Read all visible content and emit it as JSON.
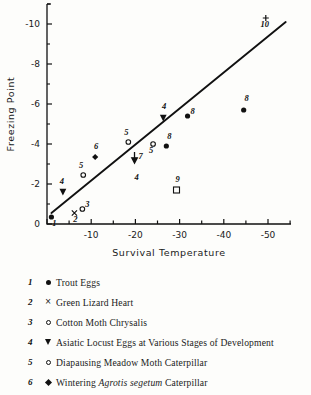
{
  "chart_data": {
    "type": "scatter",
    "title": "",
    "xlabel": "Survival Temperature",
    "ylabel": "Freezing Point",
    "xlim": [
      0,
      -55
    ],
    "ylim": [
      0,
      -11
    ],
    "xticks": [
      0,
      -10,
      -20,
      -30,
      -40,
      -50
    ],
    "xticklabels": [
      "",
      "-10",
      "-20",
      "-30",
      "-40",
      "-50"
    ],
    "yticks": [
      0,
      -2,
      -4,
      -6,
      -8,
      -10
    ],
    "yticklabels": [
      "0",
      "-2",
      "-4",
      "-6",
      "-8",
      "-10"
    ],
    "xminor_step": 5,
    "yminor_step": 1,
    "grid": false,
    "legend_position": "below-plot",
    "trend_line": {
      "label": "regression line",
      "x_start": -1.0,
      "y_start": -0.55,
      "x_end": -54.0,
      "y_end": -10.1
    },
    "points": [
      {
        "label": "1",
        "series": "Trout Eggs",
        "marker": "filled-circle",
        "x": -1.0,
        "y": -0.35,
        "label_dx": 3,
        "label_dy": 9
      },
      {
        "label": "2",
        "series": "Green Lizard Heart",
        "marker": "cross",
        "x": -6.2,
        "y": -0.55,
        "label_dx": 1,
        "label_dy": 9
      },
      {
        "label": "3",
        "series": "Cotton Moth Chrysalis",
        "marker": "open-circle",
        "x": -8.0,
        "y": -0.75,
        "label_dx": 5,
        "label_dy": -2
      },
      {
        "label": "4",
        "series": "Asiatic Locust Eggs at Various Stages of Development",
        "marker": "triangle-down",
        "x": -3.6,
        "y": -1.6,
        "label_dx": -1,
        "label_dy": -8
      },
      {
        "label": "5",
        "series": "Diapausing Meadow Moth Caterpillar",
        "marker": "open-circle",
        "x": -8.2,
        "y": -2.45,
        "label_dx": -2,
        "label_dy": -7
      },
      {
        "label": "6",
        "series": "Wintering Agrotis segetum Caterpillar",
        "marker": "diamond",
        "x": -10.9,
        "y": -3.35,
        "label_dx": 1,
        "label_dy": -8
      },
      {
        "label": "5",
        "series": "Diapausing Meadow Moth Caterpillar",
        "marker": "open-circle",
        "x": -18.4,
        "y": -4.1,
        "label_dx": -2,
        "label_dy": -7
      },
      {
        "label": "7",
        "series": "unlabeled-arrow",
        "marker": "arrow-down",
        "x": -19.8,
        "y": -3.2,
        "label_dx": 6,
        "label_dy": -1
      },
      {
        "label": "4",
        "series": "Asiatic Locust Eggs at Various Stages of Development",
        "marker": "none",
        "x": -20.3,
        "y": -2.6,
        "label_dx": 0,
        "label_dy": 8
      },
      {
        "label": "5",
        "series": "Diapausing Meadow Moth Caterpillar",
        "marker": "open-circle",
        "x": -24.0,
        "y": -4.0,
        "label_dx": -2,
        "label_dy": 9
      },
      {
        "label": "4",
        "series": "Asiatic Locust Eggs at Various Stages of Development",
        "marker": "triangle-down",
        "x": -26.3,
        "y": -5.3,
        "label_dx": 1,
        "label_dy": -9
      },
      {
        "label": "8",
        "series": "unlabeled-8",
        "marker": "filled-circle",
        "x": -27.0,
        "y": -3.9,
        "label_dx": 3,
        "label_dy": -7
      },
      {
        "label": "8",
        "series": "unlabeled-8",
        "marker": "filled-circle",
        "x": -31.8,
        "y": -5.4,
        "label_dx": 5,
        "label_dy": -2
      },
      {
        "label": "9",
        "series": "unlabeled-9",
        "marker": "open-square",
        "x": -29.3,
        "y": -1.7,
        "label_dx": 1,
        "label_dy": -8
      },
      {
        "label": "8",
        "series": "unlabeled-8",
        "marker": "filled-circle",
        "x": -44.5,
        "y": -5.7,
        "label_dx": 3,
        "label_dy": -9
      },
      {
        "label": "10",
        "series": "unlabeled-10",
        "marker": "plus",
        "x": -49.5,
        "y": -10.3,
        "label_dx": -1,
        "label_dy": 9
      }
    ]
  },
  "legend": {
    "items": [
      {
        "num": "1",
        "symbol": "filled-circle",
        "text": "Trout Eggs",
        "italic_part": ""
      },
      {
        "num": "2",
        "symbol": "cross",
        "text": "Green Lizard Heart",
        "italic_part": ""
      },
      {
        "num": "3",
        "symbol": "open-circle",
        "text": "Cotton Moth Chrysalis",
        "italic_part": ""
      },
      {
        "num": "4",
        "symbol": "triangle-down",
        "text": "Asiatic Locust Eggs at Various Stages of Development",
        "italic_part": ""
      },
      {
        "num": "5",
        "symbol": "open-circle",
        "text": "Diapausing Meadow Moth Caterpillar",
        "italic_part": ""
      },
      {
        "num": "6",
        "symbol": "diamond",
        "text": "Wintering Agrotis segetum Caterpillar",
        "italic_part": "Agrotis segetum",
        "text_before": "Wintering ",
        "text_after": " Caterpillar"
      }
    ]
  },
  "colors": {
    "ink": "#111111",
    "background": "#fdfdfb"
  }
}
